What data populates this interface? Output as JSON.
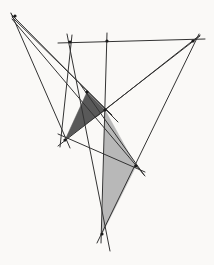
{
  "figure": {
    "width": 214,
    "height": 265,
    "background_color": "#faf9f7",
    "line_color": "#333333",
    "line_width": 1.0,
    "node_color": "#1a1a1a"
  },
  "palette": {
    "dark_triangle_fill": "#595959",
    "light_triangle_fill": "#b8b8b8",
    "stroke": "#333333",
    "background": "#faf9f7"
  },
  "chart_data": {
    "type": "diagram",
    "xlim": [
      0,
      214
    ],
    "ylim": [
      0,
      265
    ],
    "points": [
      {
        "id": "A",
        "label": "top-left-apex",
        "x": 15,
        "y": 16
      },
      {
        "id": "B",
        "label": "top-bar-left",
        "x": 70,
        "y": 42
      },
      {
        "id": "C",
        "label": "top-bar-mid",
        "x": 107,
        "y": 41
      },
      {
        "id": "D",
        "label": "top-right-apex",
        "x": 193,
        "y": 41
      },
      {
        "id": "E",
        "label": "dark-triangle-apex",
        "x": 87,
        "y": 92
      },
      {
        "id": "F",
        "label": "central-hub",
        "x": 105,
        "y": 110
      },
      {
        "id": "G",
        "label": "left-node",
        "x": 65,
        "y": 140
      },
      {
        "id": "H",
        "label": "right-node",
        "x": 136,
        "y": 166
      },
      {
        "id": "I",
        "label": "bottom-apex",
        "x": 102,
        "y": 234
      }
    ],
    "segments": [
      {
        "name": "top-bar",
        "from": [
          58,
          43
        ],
        "to": [
          205,
          39
        ]
      },
      {
        "name": "A-to-G-extended",
        "from": [
          11,
          13
        ],
        "to": [
          70,
          148
        ]
      },
      {
        "name": "A-to-F-extended",
        "from": [
          11,
          14
        ],
        "to": [
          118,
          122
        ]
      },
      {
        "name": "A-to-E-extended",
        "from": [
          12,
          17
        ],
        "to": [
          112,
          115
        ]
      },
      {
        "name": "A-to-H-extended",
        "from": [
          12,
          19
        ],
        "to": [
          145,
          176
        ]
      },
      {
        "name": "B-to-I-extended",
        "from": [
          67,
          34
        ],
        "to": [
          110,
          251
        ]
      },
      {
        "name": "C-vertical-to-I",
        "from": [
          107,
          33
        ],
        "to": [
          101,
          243
        ]
      },
      {
        "name": "D-to-F-extended",
        "from": [
          200,
          35
        ],
        "to": [
          96,
          117
        ]
      },
      {
        "name": "D-to-I-extended",
        "from": [
          199,
          34
        ],
        "to": [
          97,
          243
        ]
      },
      {
        "name": "G-to-D-ray",
        "from": [
          58,
          146
        ],
        "to": [
          200,
          36
        ]
      },
      {
        "name": "E-to-H-extended",
        "from": [
          80,
          84
        ],
        "to": [
          144,
          175
        ]
      },
      {
        "name": "G-to-H-extended",
        "from": [
          58,
          134
        ],
        "to": [
          145,
          172
        ]
      },
      {
        "name": "B-to-G-diagonal",
        "from": [
          72,
          35
        ],
        "to": [
          60,
          147
        ]
      }
    ],
    "polygons": [
      {
        "name": "dark-triangle",
        "fill": "#595959",
        "vertices": [
          [
            87,
            92
          ],
          [
            105,
            110
          ],
          [
            65,
            140
          ]
        ]
      },
      {
        "name": "light-triangle",
        "fill": "#b8b8b8",
        "vertices": [
          [
            105,
            110
          ],
          [
            136,
            166
          ],
          [
            102,
            234
          ]
        ]
      }
    ]
  }
}
